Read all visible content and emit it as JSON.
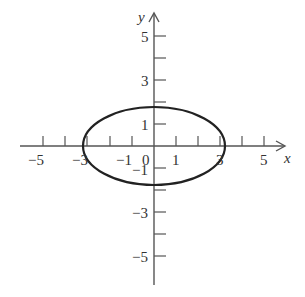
{
  "diagram": {
    "type": "ellipse-on-axes",
    "axes": {
      "x_label": "x",
      "y_label": "y",
      "x_tick_labels": [
        "−5",
        "−3",
        "−1",
        "0",
        "1",
        "3",
        "5"
      ],
      "y_tick_labels": [
        "5",
        "3",
        "1",
        "−1",
        "−3",
        "−5"
      ]
    },
    "ellipse": {
      "center": [
        0,
        0
      ],
      "semi_axis_x": 3,
      "semi_axis_y": 1.8
    },
    "colors": {
      "axis": "#555555",
      "curve": "#222222",
      "text": "#333333"
    }
  }
}
